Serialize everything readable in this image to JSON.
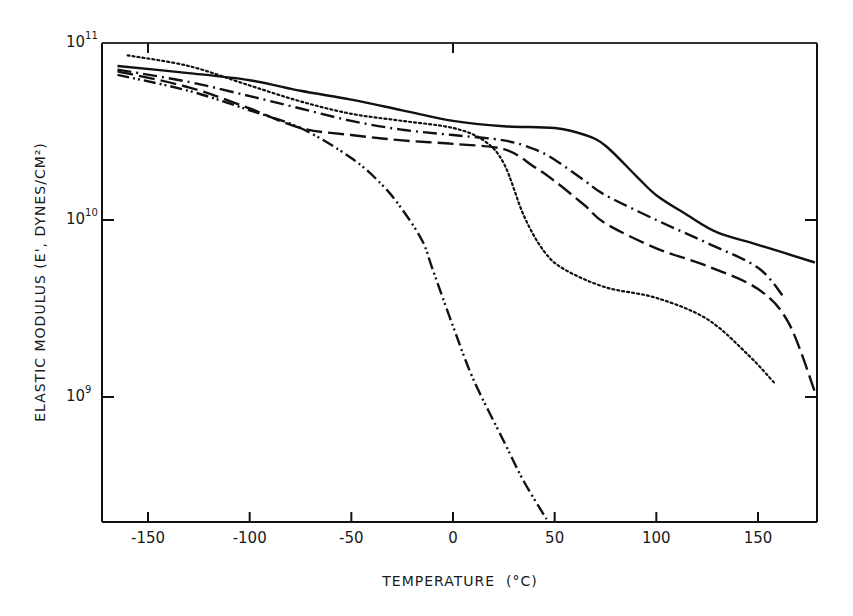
{
  "chart_data": {
    "type": "line",
    "title": "",
    "xlabel": "TEMPERATURE  (°C)",
    "ylabel": "ELASTIC MODULUS (E', DYNES/CM²)",
    "yscale": "log",
    "xlim": [
      -172,
      178
    ],
    "ylim_log10": [
      8.29,
      11.0
    ],
    "x_ticks": [
      -150,
      -100,
      -50,
      0,
      50,
      100,
      150
    ],
    "x_tick_labels": [
      "-150",
      "-100",
      "-50",
      "0",
      "50",
      "100",
      "150"
    ],
    "y_ticks_log10": [
      11,
      10,
      9
    ],
    "y_tick_labels": [
      {
        "base": "10",
        "exp": "11"
      },
      {
        "base": "10",
        "exp": "10"
      },
      {
        "base": "10",
        "exp": "9"
      }
    ],
    "grid": false,
    "legend": "none",
    "series": [
      {
        "name": "solid",
        "style": "solid",
        "x": [
          -165,
          -130,
          -100,
          -75,
          -50,
          -25,
          0,
          25,
          50,
          65,
          75,
          90,
          100,
          115,
          130,
          150,
          178
        ],
        "log10_y": [
          10.87,
          10.83,
          10.79,
          10.73,
          10.68,
          10.62,
          10.56,
          10.53,
          10.52,
          10.48,
          10.42,
          10.25,
          10.14,
          10.03,
          9.93,
          9.86,
          9.76
        ]
      },
      {
        "name": "dash-dot",
        "style": "dash-dot",
        "x": [
          -165,
          -130,
          -100,
          -75,
          -50,
          -25,
          0,
          25,
          40,
          50,
          65,
          75,
          100,
          125,
          150,
          163
        ],
        "log10_y": [
          10.85,
          10.78,
          10.7,
          10.63,
          10.56,
          10.51,
          10.48,
          10.45,
          10.4,
          10.34,
          10.22,
          10.14,
          10.0,
          9.87,
          9.73,
          9.56
        ]
      },
      {
        "name": "dashed",
        "style": "dashed",
        "x": [
          -165,
          -130,
          -100,
          -75,
          -50,
          -25,
          0,
          25,
          40,
          50,
          65,
          75,
          100,
          125,
          150,
          165,
          178
        ],
        "log10_y": [
          10.84,
          10.75,
          10.63,
          10.52,
          10.48,
          10.45,
          10.43,
          10.4,
          10.3,
          10.22,
          10.08,
          9.98,
          9.84,
          9.74,
          9.61,
          9.42,
          9.03
        ]
      },
      {
        "name": "dotted",
        "style": "dotted",
        "x": [
          -160,
          -130,
          -100,
          -75,
          -50,
          -25,
          0,
          15,
          25,
          35,
          45,
          55,
          75,
          100,
          125,
          145,
          158
        ],
        "log10_y": [
          10.93,
          10.87,
          10.76,
          10.67,
          10.6,
          10.56,
          10.52,
          10.45,
          10.32,
          10.02,
          9.82,
          9.72,
          9.62,
          9.56,
          9.44,
          9.24,
          9.08
        ]
      },
      {
        "name": "dash-dot-dot",
        "style": "dash-dot-dot",
        "x": [
          -165,
          -130,
          -100,
          -75,
          -50,
          -35,
          -25,
          -15,
          -10,
          0,
          10,
          25,
          35,
          46
        ],
        "log10_y": [
          10.82,
          10.73,
          10.62,
          10.52,
          10.35,
          10.2,
          10.06,
          9.88,
          9.72,
          9.4,
          9.1,
          8.75,
          8.52,
          8.31
        ]
      }
    ]
  }
}
